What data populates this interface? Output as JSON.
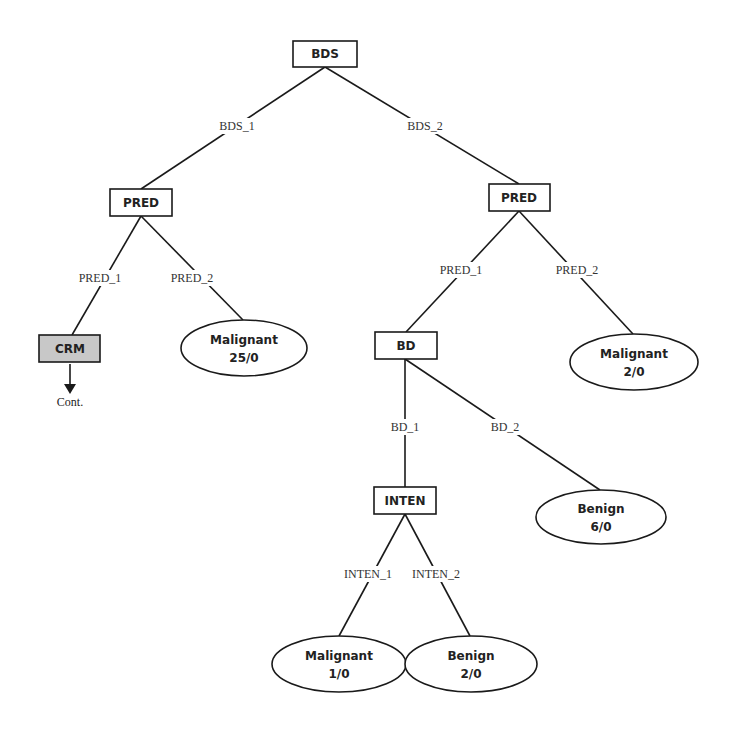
{
  "diagram": {
    "type": "decision-tree",
    "nodes": {
      "root": {
        "label": "BDS"
      },
      "pred_left": {
        "label": "PRED"
      },
      "pred_right": {
        "label": "PRED"
      },
      "crm": {
        "label": "CRM",
        "continuation": "Cont."
      },
      "bd": {
        "label": "BD"
      },
      "inten": {
        "label": "INTEN"
      }
    },
    "leaves": {
      "leaf_pred2_left": {
        "class": "Malignant",
        "count": "25/0"
      },
      "leaf_pred2_right": {
        "class": "Malignant",
        "count": "2/0"
      },
      "leaf_bd2": {
        "class": "Benign",
        "count": "6/0"
      },
      "leaf_inten1": {
        "class": "Malignant",
        "count": "1/0"
      },
      "leaf_inten2": {
        "class": "Benign",
        "count": "2/0"
      }
    },
    "edges": {
      "bds_1": "BDS_1",
      "bds_2": "BDS_2",
      "pred_left_1": "PRED_1",
      "pred_left_2": "PRED_2",
      "pred_right_1": "PRED_1",
      "pred_right_2": "PRED_2",
      "bd_1": "BD_1",
      "bd_2": "BD_2",
      "inten_1": "INTEN_1",
      "inten_2": "INTEN_2"
    },
    "colors": {
      "line": "#1a1a1a",
      "continued_node_fill": "#c8c8c8"
    }
  }
}
